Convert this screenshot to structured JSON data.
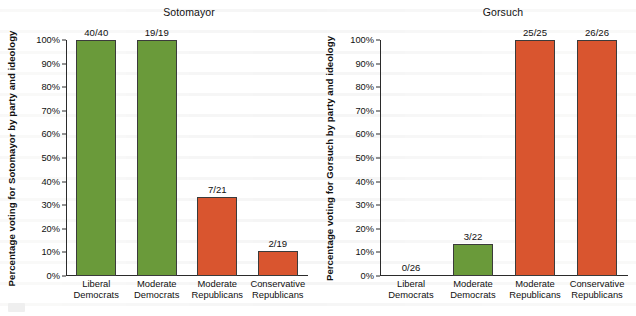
{
  "figure": {
    "background_color": "#ffffff",
    "palette": {
      "democrat_green": "#6a9a3a",
      "republican_orange": "#d9552f",
      "axis": "#2b2b2b",
      "text": "#111111"
    }
  },
  "chart_data": [
    {
      "type": "bar",
      "title": "Sotomayor",
      "xlabel": "",
      "ylabel": "Percentage voting for Sotomayor by party and ideology",
      "ylim": [
        0,
        100
      ],
      "ytick_labels": [
        "100%",
        "90%",
        "80%",
        "70%",
        "60%",
        "50%",
        "40%",
        "30%",
        "20%",
        "10%",
        "0%"
      ],
      "ytick_values": [
        100,
        90,
        80,
        70,
        60,
        50,
        40,
        30,
        20,
        10,
        0
      ],
      "grid": false,
      "legend": "none",
      "categories": [
        "Liberal Democrats",
        "Moderate Democrats",
        "Moderate Republicans",
        "Conservative Republicans"
      ],
      "category_lines": [
        [
          "Liberal",
          "Democrats"
        ],
        [
          "Moderate",
          "Democrats"
        ],
        [
          "Moderate",
          "Republicans"
        ],
        [
          "Conservative",
          "Republicans"
        ]
      ],
      "values": [
        100.0,
        100.0,
        33.3,
        10.5
      ],
      "data_labels": [
        "40/40",
        "19/19",
        "7/21",
        "2/19"
      ],
      "bar_colors": [
        "#6a9a3a",
        "#6a9a3a",
        "#d9552f",
        "#d9552f"
      ]
    },
    {
      "type": "bar",
      "title": "Gorsuch",
      "xlabel": "",
      "ylabel": "Percentage voting for Gorsuch by party and ideology",
      "ylim": [
        0,
        100
      ],
      "ytick_labels": [
        "100%",
        "90%",
        "80%",
        "70%",
        "60%",
        "50%",
        "40%",
        "30%",
        "20%",
        "10%",
        "0%"
      ],
      "ytick_values": [
        100,
        90,
        80,
        70,
        60,
        50,
        40,
        30,
        20,
        10,
        0
      ],
      "grid": false,
      "legend": "none",
      "categories": [
        "Liberal Democrats",
        "Moderate Democrats",
        "Moderate Republicans",
        "Conservative Republicans"
      ],
      "category_lines": [
        [
          "Liberal",
          "Democrats"
        ],
        [
          "Moderate",
          "Democrats"
        ],
        [
          "Moderate",
          "Republicans"
        ],
        [
          "Conservative",
          "Republicans"
        ]
      ],
      "values": [
        0.0,
        13.6,
        100.0,
        100.0
      ],
      "data_labels": [
        "0/26",
        "3/22",
        "25/25",
        "26/26"
      ],
      "bar_colors": [
        "#6a9a3a",
        "#6a9a3a",
        "#d9552f",
        "#d9552f"
      ]
    }
  ]
}
